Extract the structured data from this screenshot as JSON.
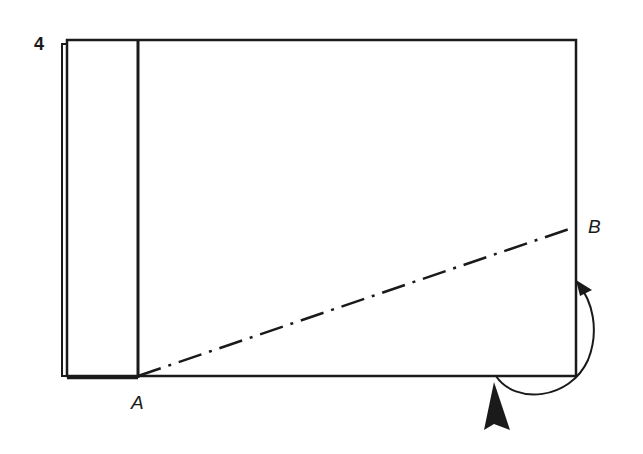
{
  "diagram": {
    "step_number": "4",
    "points": [
      {
        "id": "A",
        "label": "A"
      },
      {
        "id": "B",
        "label": "B"
      }
    ],
    "elements": {
      "sheet": "rectangle paper",
      "flap": "folded strip on left edge",
      "fold_line": "dash-dot line from A to B",
      "fold_arrow": "curved arrow from bottom edge to right edge",
      "push_arrow": "solid arrowhead pointing up at bottom edge"
    },
    "colors": {
      "ink": "#1a1a1a",
      "background": "#ffffff"
    }
  }
}
